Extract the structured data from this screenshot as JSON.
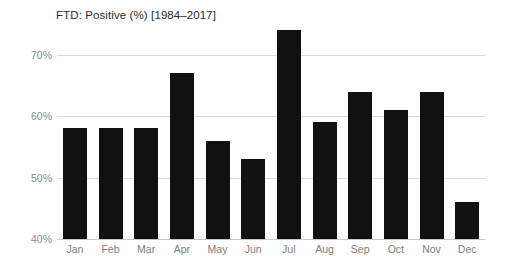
{
  "chart_data": {
    "type": "bar",
    "title": "FTD: Positive (%) [1984–2017]",
    "xlabel": "",
    "ylabel": "",
    "categories": [
      "Jan",
      "Feb",
      "Mar",
      "Apr",
      "May",
      "Jun",
      "Jul",
      "Aug",
      "Sep",
      "Oct",
      "Nov",
      "Dec"
    ],
    "values": [
      58,
      58,
      58,
      67,
      56,
      53,
      74,
      59,
      64,
      61,
      64,
      46
    ],
    "ylim": [
      40,
      75
    ],
    "yticks": [
      40,
      50,
      60,
      70
    ],
    "ytick_labels": [
      "40%",
      "50%",
      "60%",
      "70%"
    ],
    "grid": true,
    "legend": "none",
    "colors": {
      "bar": "#111111",
      "gridline": "#dcdcdc",
      "axis": "#c9c9c9",
      "tick_text": "#8a8a8a",
      "title_text": "#2b2b2b",
      "background": "#ffffff"
    }
  }
}
